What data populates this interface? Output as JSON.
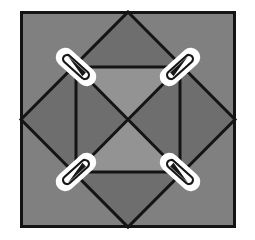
{
  "figure": {
    "canvas_width": 255,
    "canvas_height": 240,
    "background_color": "#ffffff"
  },
  "colors": {
    "page_background": "#ffffff",
    "outer_fill": "#808080",
    "dark_gray_fill": "#6e6e6e",
    "light_gray_fill": "#939393",
    "mid_gray_fill": "#808080",
    "line_color": "#141414",
    "marker_outline": "#ffffff",
    "marker_core": "#171717"
  },
  "outer_square": {
    "label": "outer square frame",
    "x": 20,
    "y": 11,
    "width": 216,
    "height": 217,
    "stroke_width": 3,
    "fill": "#808080",
    "stroke": "#141414"
  },
  "diamond": {
    "label": "inscribed rotated square (diamond)",
    "points": "128,12 235,119.5 128,227 21,119.5",
    "stroke_width": 3,
    "fill": "#6e6e6e",
    "stroke": "#141414"
  },
  "inner_square": {
    "label": "inner axis aligned square",
    "x": 76,
    "y": 67,
    "width": 104,
    "height": 105,
    "stroke_width": 3,
    "fill": "#6e6e6e",
    "stroke": "#141414"
  },
  "inner_triangles": [
    {
      "name": "top-triangle",
      "points": "76,67 180,67 128,119.5",
      "fill": "#939393"
    },
    {
      "name": "right-triangle",
      "points": "180,67 180,172 128,119.5",
      "fill": "#6e6e6e"
    },
    {
      "name": "bottom-triangle",
      "points": "76,172 180,172 128,119.5",
      "fill": "#939393"
    },
    {
      "name": "left-triangle",
      "points": "76,67 76,172 128,119.5",
      "fill": "#6e6e6e"
    }
  ],
  "diagonals": [
    {
      "name": "diagonal-top-left-to-bottom-right",
      "x1": 76,
      "y1": 67,
      "x2": 180,
      "y2": 172
    },
    {
      "name": "diagonal-top-right-to-bottom-left",
      "x1": 180,
      "y1": 67,
      "x2": 76,
      "y2": 172
    }
  ],
  "markers": [
    {
      "name": "marker-top-left",
      "position": "top-left",
      "cx": 76,
      "cy": 67,
      "rotation_deg": 42,
      "length": 46,
      "thickness": 17
    },
    {
      "name": "marker-top-right",
      "position": "top-right",
      "cx": 180,
      "cy": 67,
      "rotation_deg": -42,
      "length": 46,
      "thickness": 17
    },
    {
      "name": "marker-bottom-left",
      "position": "bottom-left",
      "cx": 76,
      "cy": 172,
      "rotation_deg": -42,
      "length": 46,
      "thickness": 17
    },
    {
      "name": "marker-bottom-right",
      "position": "bottom-right",
      "cx": 180,
      "cy": 172,
      "rotation_deg": 42,
      "length": 46,
      "thickness": 17
    }
  ]
}
